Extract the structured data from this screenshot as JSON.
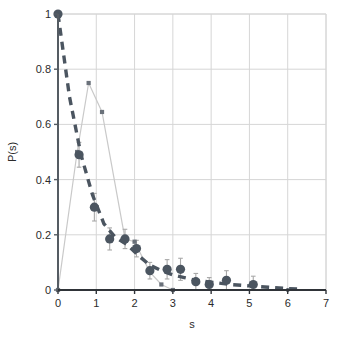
{
  "chart_data": {
    "type": "scatter",
    "title": "",
    "xlabel": "s",
    "ylabel": "P(s)",
    "xlim": [
      0,
      7
    ],
    "ylim": [
      0,
      1
    ],
    "xticks": [
      0,
      1,
      2,
      3,
      4,
      5,
      6,
      7
    ],
    "yticks": [
      0,
      0.2,
      0.4,
      0.6,
      0.8,
      1
    ],
    "xtick_labels": [
      "0",
      "1",
      "2",
      "3",
      "4",
      "5",
      "6",
      "7"
    ],
    "ytick_labels": [
      "0",
      "0.2",
      "0.4",
      "0.6",
      "0.8",
      "1"
    ],
    "grid": true,
    "legend": "none",
    "series": [
      {
        "name": "data-circles",
        "marker": "circle",
        "color": "#4b5560",
        "errorbars": true,
        "x": [
          0.0,
          0.55,
          0.95,
          1.35,
          1.75,
          2.05,
          2.4,
          2.85,
          3.2,
          3.6,
          3.95,
          4.4,
          5.1,
          6.0
        ],
        "y": [
          1.0,
          0.49,
          0.3,
          0.185,
          0.185,
          0.15,
          0.07,
          0.075,
          0.075,
          0.03,
          0.02,
          0.035,
          0.02,
          0.0
        ],
        "yerr": [
          0.0,
          0.045,
          0.05,
          0.04,
          0.035,
          0.03,
          0.03,
          0.035,
          0.04,
          0.03,
          0.025,
          0.035,
          0.03,
          0.0
        ]
      },
      {
        "name": "histogram-squares",
        "marker": "square",
        "color": "#6a717a",
        "line_color": "#c9c9c9",
        "x": [
          0.0,
          0.5,
          0.8,
          1.15,
          1.75,
          2.0,
          2.4,
          2.7,
          3.0
        ],
        "y": [
          0.0,
          0.5,
          0.75,
          0.645,
          0.185,
          0.175,
          0.065,
          0.02,
          0.0
        ]
      },
      {
        "name": "exponential-fit",
        "marker": "none",
        "style": "dashed",
        "color": "#4b5560",
        "x": [
          0.0,
          0.3,
          0.6,
          0.9,
          1.2,
          1.5,
          1.8,
          2.1,
          2.4,
          2.7,
          3.0,
          3.3,
          3.6,
          3.9,
          4.2,
          4.5,
          5.0,
          5.5,
          6.0,
          6.4
        ],
        "y": [
          1.0,
          0.7,
          0.49,
          0.345,
          0.24,
          0.19,
          0.165,
          0.125,
          0.09,
          0.07,
          0.055,
          0.045,
          0.035,
          0.03,
          0.025,
          0.02,
          0.015,
          0.01,
          0.005,
          0.003
        ]
      }
    ]
  }
}
